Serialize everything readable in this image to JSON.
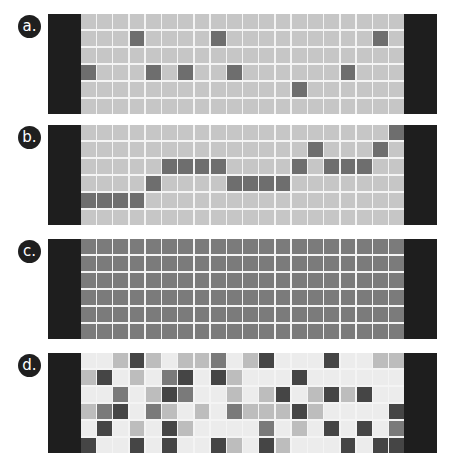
{
  "shade_colors": {
    "a_base": "#c6c6c6",
    "a_dark": "#6e6e6e",
    "c_fill": "#7b7b7b",
    "d_levels": [
      "#ececec",
      "#bdbdbd",
      "#7a7a7a",
      "#454545"
    ],
    "bar": "#1e1e1e"
  },
  "panels": [
    {
      "label": "a.",
      "type": "binary",
      "rows": 6,
      "cols": 20,
      "dark_cells": [
        [
          1,
          3
        ],
        [
          1,
          8
        ],
        [
          1,
          18
        ],
        [
          3,
          0
        ],
        [
          3,
          4
        ],
        [
          3,
          6
        ],
        [
          3,
          9
        ],
        [
          3,
          16
        ],
        [
          4,
          13
        ]
      ]
    },
    {
      "label": "b.",
      "type": "binary",
      "rows": 6,
      "cols": 20,
      "dark_cells": [
        [
          0,
          19
        ],
        [
          1,
          14
        ],
        [
          1,
          18
        ],
        [
          2,
          5
        ],
        [
          2,
          6
        ],
        [
          2,
          7
        ],
        [
          2,
          8
        ],
        [
          2,
          13
        ],
        [
          2,
          15
        ],
        [
          2,
          16
        ],
        [
          2,
          17
        ],
        [
          3,
          4
        ],
        [
          3,
          9
        ],
        [
          3,
          10
        ],
        [
          3,
          11
        ],
        [
          3,
          12
        ],
        [
          4,
          0
        ],
        [
          4,
          1
        ],
        [
          4,
          2
        ],
        [
          4,
          3
        ]
      ]
    },
    {
      "label": "c.",
      "type": "uniform",
      "rows": 6,
      "cols": 20
    },
    {
      "label": "d.",
      "type": "levels",
      "rows": 6,
      "cols": 20,
      "grid": [
        [
          0,
          0,
          1,
          3,
          1,
          0,
          1,
          1,
          2,
          0,
          1,
          3,
          0,
          0,
          0,
          3,
          0,
          0,
          1,
          1
        ],
        [
          1,
          3,
          0,
          1,
          0,
          2,
          3,
          0,
          3,
          1,
          0,
          0,
          0,
          3,
          0,
          0,
          0,
          0,
          0,
          0
        ],
        [
          0,
          0,
          2,
          0,
          1,
          3,
          2,
          0,
          0,
          1,
          0,
          1,
          3,
          0,
          1,
          3,
          1,
          3,
          0,
          0
        ],
        [
          1,
          2,
          3,
          0,
          2,
          1,
          0,
          1,
          0,
          2,
          1,
          1,
          1,
          3,
          1,
          0,
          0,
          0,
          0,
          3
        ],
        [
          0,
          3,
          0,
          1,
          0,
          3,
          1,
          0,
          0,
          0,
          0,
          2,
          0,
          1,
          0,
          3,
          0,
          3,
          0,
          2
        ],
        [
          3,
          0,
          0,
          3,
          0,
          3,
          0,
          0,
          3,
          1,
          0,
          3,
          1,
          0,
          0,
          0,
          3,
          0,
          3,
          3
        ]
      ]
    }
  ]
}
